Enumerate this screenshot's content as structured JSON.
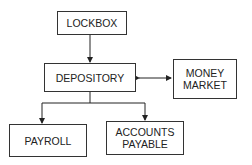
{
  "diagram": {
    "nodes": {
      "lockbox": {
        "label": "LOCKBOX"
      },
      "depository": {
        "label": "DEPOSITORY"
      },
      "money_market": {
        "line1": "MONEY",
        "line2": "MARKET"
      },
      "payroll": {
        "label": "PAYROLL"
      },
      "accounts_payable": {
        "line1": "ACCOUNTS",
        "line2": "PAYABLE"
      }
    },
    "edges": [
      {
        "from": "LOCKBOX",
        "to": "DEPOSITORY",
        "type": "arrow"
      },
      {
        "from": "DEPOSITORY",
        "to": "MONEY MARKET",
        "type": "bidirectional"
      },
      {
        "from": "DEPOSITORY",
        "to": "PAYROLL",
        "type": "arrow"
      },
      {
        "from": "DEPOSITORY",
        "to": "ACCOUNTS PAYABLE",
        "type": "arrow"
      }
    ]
  }
}
